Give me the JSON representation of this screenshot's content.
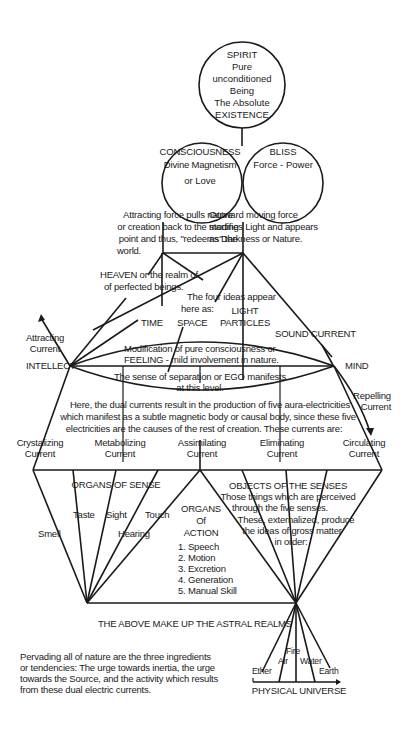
{
  "spirit": {
    "lines": [
      "SPIRIT",
      "Pure",
      "unconditioned",
      "Being",
      "The Absolute",
      "EXISTENCE"
    ]
  },
  "consciousness": {
    "lines": [
      "CONSCIOUSNESS",
      "Divine Magnetism",
      "or Love"
    ]
  },
  "bliss": {
    "lines": [
      "BLISS",
      "Force - Power"
    ]
  },
  "attracting_force": {
    "lines": [
      "Attracting force pulls nature",
      "or creation back to the starting",
      "point and thus, \"redeems\" the",
      "world."
    ]
  },
  "outward_force": {
    "lines": [
      "Outward moving force",
      "modifies Light and appears",
      "as Darkness or Nature."
    ]
  },
  "heaven": {
    "lines": [
      "HEAVEN or the realm of",
      "of perfected beings."
    ]
  },
  "four_ideas": {
    "lines": [
      "The four ideas appear",
      "here as:"
    ],
    "items": {
      "time": "TIME",
      "space": "SPACE",
      "light_1": "LIGHT",
      "light_2": "PARTICLES",
      "sound": "SOUND CURRENT"
    }
  },
  "attracting_current": {
    "lines": [
      "Attracting",
      "Current"
    ]
  },
  "repelling_current": {
    "lines": [
      "Repelling",
      "Current"
    ]
  },
  "intellect": "INTELLECT",
  "mind": "MIND",
  "feeling": {
    "lines": [
      "Modification of pure consciousness or",
      "FEELING - mild involvement in nature."
    ]
  },
  "ego": {
    "lines": [
      "The sense of separation or EGO manifests",
      "at this level."
    ]
  },
  "dual_currents": {
    "lines": [
      "Here, the dual currents result in the production of five aura-electricities",
      "which manifest as a subtle magnetic body or causal body, since these five",
      "electricities are the causes of the rest of creation. These currents are:"
    ]
  },
  "currents": [
    {
      "line1": "Crystalizing",
      "line2": "Current"
    },
    {
      "line1": "Metabolizing",
      "line2": "Current"
    },
    {
      "line1": "Assimilating",
      "line2": "Current"
    },
    {
      "line1": "Eliminating",
      "line2": "Current"
    },
    {
      "line1": "Circulating",
      "line2": "Current"
    }
  ],
  "organs_of_sense": {
    "title": "ORGANS OF SENSE",
    "items": [
      "Smell",
      "Taste",
      "Sight",
      "Hearing",
      "Touch"
    ]
  },
  "organs_of_action": {
    "title_lines": [
      "ORGANS",
      "Of",
      "ACTION"
    ],
    "items": [
      "1. Speech",
      "2. Motion",
      "3. Excretion",
      "4. Generation",
      "5. Manual Skill"
    ]
  },
  "objects_of_senses": {
    "title": "OBJECTS OF THE SENSES",
    "lines": [
      "Those things which are perceived",
      "through the five senses.",
      "These, externalized, produce",
      "the ideas of gross matter",
      "in order:"
    ]
  },
  "astral": "THE ABOVE MAKE UP THE ASTRAL REALMS",
  "elements": [
    "Ether",
    "Air",
    "Fire",
    "Water",
    "Earth"
  ],
  "physical_universe": "PHYSICAL UNIVERSE",
  "pervading": {
    "lines": [
      "Pervading all of nature are the three ingredients",
      "or tendencies: The urge towards inertia, the urge",
      "towards the Source, and the activity which results",
      "from these dual electric currents."
    ]
  }
}
